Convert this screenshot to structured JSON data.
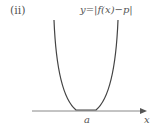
{
  "figure": {
    "part_label": "(ii)",
    "equation": "y=|f(x)−p|",
    "x_axis_label": "x",
    "point_label": "a"
  },
  "colors": {
    "curve": "#444444",
    "axis": "#777777",
    "text": "#555555"
  }
}
